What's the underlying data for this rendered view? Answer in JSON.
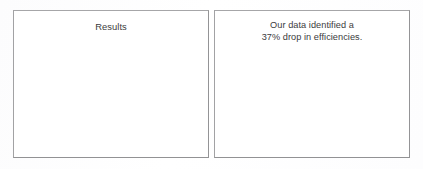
{
  "document": {
    "type": "scanned-slide",
    "background_color": "#fefefe",
    "text_color": "#3b3b3d",
    "border_color": "#9b9b9d"
  },
  "panels": {
    "left": {
      "name": "results-panel",
      "title": "Results",
      "body_lines": []
    },
    "right": {
      "name": "finding-panel",
      "title": "",
      "body_lines": [
        "Our data identified a",
        "37% drop in efficiencies."
      ]
    }
  },
  "metrics": {
    "efficiency_drop_percent": "37%"
  }
}
